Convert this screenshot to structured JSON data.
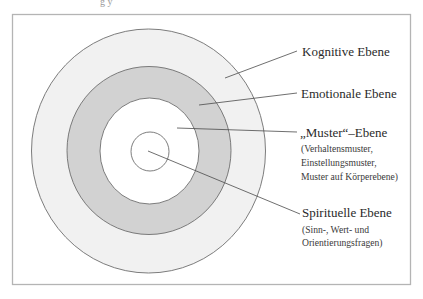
{
  "diagram": {
    "type": "concentric-levels",
    "top_fragment_text": "g y",
    "colors": {
      "frame": "#b4b4b4",
      "outer_ring_fill": "#f1f1f1",
      "middle_ring_fill": "#d2d2d2",
      "inner_ring_fill": "#ffffff",
      "core_fill": "#ffffff",
      "ring_stroke": "#6e6e6e",
      "text": "#2a2a2a"
    },
    "levels": [
      {
        "id": "kognitive",
        "label": "Kognitive Ebene",
        "sublines": []
      },
      {
        "id": "emotionale",
        "label": "Emotionale Ebene",
        "sublines": []
      },
      {
        "id": "muster",
        "label": "„Muster“–Ebene",
        "sublines": [
          "(Verhaltensmuster,",
          "Einstellungsmuster,",
          "Muster auf Körperebene)"
        ]
      },
      {
        "id": "spirituelle",
        "label": "Spirituelle Ebene",
        "sublines": [
          "(Sinn-, Wert- und",
          "Orientierungsfragen)"
        ]
      }
    ]
  }
}
